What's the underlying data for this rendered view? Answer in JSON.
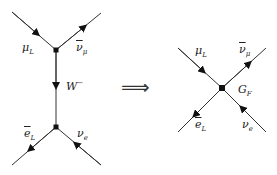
{
  "diagram": {
    "type": "feynman",
    "title": "",
    "left": {
      "name": "W-exchange",
      "vertices": [
        {
          "id": "v_top",
          "x": 56,
          "y": 50
        },
        {
          "id": "v_bottom",
          "x": 56,
          "y": 127
        }
      ],
      "lines": [
        {
          "id": "mu",
          "from": [
            12,
            12
          ],
          "to": [
            56,
            50
          ],
          "arrow": "toward-vertex",
          "label_base": "μ",
          "label_sub": "L"
        },
        {
          "id": "nubar_mu",
          "from": [
            56,
            50
          ],
          "to": [
            101,
            13
          ],
          "arrow": "away-from-vertex",
          "label_base": "ν",
          "label_sub": "μ",
          "bar": true
        },
        {
          "id": "W",
          "from": [
            56,
            50
          ],
          "to": [
            56,
            127
          ],
          "arrow": "down",
          "label_base": "W",
          "label_sup": "−"
        },
        {
          "id": "ebar",
          "from": [
            56,
            127
          ],
          "to": [
            12,
            165
          ],
          "arrow": "away-from-vertex",
          "label_base": "e",
          "label_sub": "L",
          "bar": true
        },
        {
          "id": "nu_e",
          "from": [
            101,
            165
          ],
          "to": [
            56,
            127
          ],
          "arrow": "toward-vertex",
          "label_base": "ν",
          "label_sub": "e"
        }
      ]
    },
    "arrow_symbol": "⟹",
    "right": {
      "name": "Fermi contact interaction",
      "vertices": [
        {
          "id": "v_contact",
          "x": 222,
          "y": 88
        }
      ],
      "coupling_label_base": "G",
      "coupling_label_sub": "F",
      "lines": [
        {
          "id": "mu",
          "label_base": "μ",
          "label_sub": "L",
          "arrow": "toward-vertex"
        },
        {
          "id": "nubar_mu",
          "label_base": "ν",
          "label_sub": "μ",
          "bar": true,
          "arrow": "away-from-vertex"
        },
        {
          "id": "ebar",
          "label_base": "e",
          "label_sub": "L",
          "bar": true,
          "arrow": "away-from-vertex"
        },
        {
          "id": "nu_e",
          "label_base": "ν",
          "label_sub": "e",
          "arrow": "toward-vertex"
        }
      ]
    },
    "colors": {
      "line": "#333333",
      "vertex": "#111111",
      "background": "#ffffff"
    }
  }
}
